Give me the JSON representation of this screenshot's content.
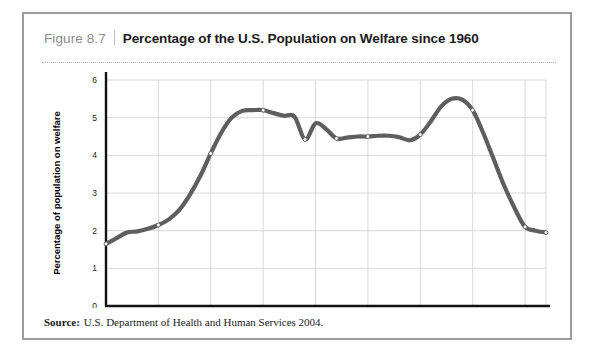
{
  "figure": {
    "number": "Figure 8.7",
    "title": "Percentage of the U.S. Population on Welfare since 1960",
    "source_label": "Source:",
    "source_text": "U.S. Department of Health and Human Services 2004."
  },
  "colors": {
    "line": "#5e5e5e",
    "grid": "#d9d9d9",
    "axis": "#111111",
    "frame": "#9a9a9a",
    "figure_number": "#8c8c8c",
    "marker_fill": "#ffffff"
  },
  "chart_data": {
    "type": "line",
    "title": "Percentage of the U.S. Population on Welfare since 1960",
    "xlabel": "",
    "ylabel": "Percentage of population on welfare",
    "xlim": [
      1960,
      2002
    ],
    "ylim": [
      0,
      6
    ],
    "ytick_labels": [
      "0",
      "1",
      "2",
      "3",
      "4",
      "5",
      "6"
    ],
    "yticks": [
      0,
      1,
      2,
      3,
      4,
      5,
      6
    ],
    "xtick_labels": [
      "1960",
      "1965",
      "1970",
      "1975",
      "1980",
      "1985",
      "1990",
      "1995",
      "2000",
      "2002"
    ],
    "xticks": [
      1960,
      1965,
      1970,
      1975,
      1980,
      1985,
      1990,
      1995,
      2000,
      2002
    ],
    "grid": true,
    "legend": "none",
    "series": [
      {
        "name": "Percentage of population on welfare",
        "x": [
          1960,
          1961,
          1962,
          1963,
          1964,
          1965,
          1966,
          1967,
          1968,
          1969,
          1970,
          1971,
          1972,
          1973,
          1974,
          1975,
          1976,
          1977,
          1978,
          1979,
          1980,
          1981,
          1982,
          1983,
          1984,
          1985,
          1986,
          1987,
          1988,
          1989,
          1990,
          1991,
          1992,
          1993,
          1994,
          1995,
          1996,
          1997,
          1998,
          1999,
          2000,
          2001,
          2002
        ],
        "values": [
          1.65,
          1.8,
          1.95,
          1.98,
          2.05,
          2.15,
          2.3,
          2.55,
          2.95,
          3.45,
          4.05,
          4.6,
          5.0,
          5.18,
          5.2,
          5.2,
          5.12,
          5.05,
          5.03,
          4.42,
          4.85,
          4.7,
          4.45,
          4.47,
          4.5,
          4.5,
          4.52,
          4.52,
          4.48,
          4.4,
          4.55,
          4.9,
          5.3,
          5.5,
          5.48,
          5.2,
          4.6,
          3.9,
          3.2,
          2.6,
          2.1,
          2.0,
          1.95
        ]
      }
    ],
    "markers": [
      {
        "x": 1960,
        "y": 1.65
      },
      {
        "x": 1965,
        "y": 2.15
      },
      {
        "x": 1970,
        "y": 4.05
      },
      {
        "x": 1975,
        "y": 5.2
      },
      {
        "x": 1979,
        "y": 4.42
      },
      {
        "x": 1982,
        "y": 4.45
      },
      {
        "x": 1985,
        "y": 4.5
      },
      {
        "x": 1990,
        "y": 4.55
      },
      {
        "x": 1995,
        "y": 5.2
      },
      {
        "x": 2000,
        "y": 2.1
      },
      {
        "x": 2002,
        "y": 1.95
      }
    ]
  }
}
